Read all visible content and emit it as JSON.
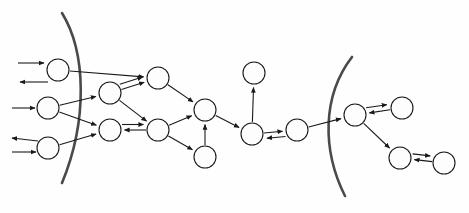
{
  "diagram": {
    "title": "",
    "type": "directed-graph-with-boundaries",
    "style": {
      "background": "#fefefe",
      "node_fill": "#fdfdfd",
      "node_stroke": "#1a1a1a",
      "node_stroke_width": 1.1,
      "edge_stroke": "#1a1a1a",
      "edge_stroke_width": 1.1,
      "boundary_stroke": "#4a4a4a",
      "boundary_stroke_width": 2.6,
      "arrowhead": "solid-triangle"
    },
    "node_radius": 11,
    "nodes": [
      {
        "id": "L1",
        "label": "",
        "cx": 58,
        "cy": 70,
        "r": 11,
        "group": "left-outer"
      },
      {
        "id": "L2",
        "label": "",
        "cx": 48,
        "cy": 108,
        "r": 11,
        "group": "left-outer"
      },
      {
        "id": "L3",
        "label": "",
        "cx": 48,
        "cy": 148,
        "r": 11,
        "group": "left-outer"
      },
      {
        "id": "M1",
        "label": "",
        "cx": 110,
        "cy": 93,
        "r": 11,
        "group": "left-inner"
      },
      {
        "id": "M2",
        "label": "",
        "cx": 110,
        "cy": 130,
        "r": 11,
        "group": "left-inner"
      },
      {
        "id": "M3",
        "label": "",
        "cx": 158,
        "cy": 78,
        "r": 11,
        "group": "middle"
      },
      {
        "id": "M4",
        "label": "",
        "cx": 158,
        "cy": 130,
        "r": 11,
        "group": "middle"
      },
      {
        "id": "M5",
        "label": "",
        "cx": 205,
        "cy": 110,
        "r": 11,
        "group": "middle"
      },
      {
        "id": "M6",
        "label": "",
        "cx": 205,
        "cy": 157,
        "r": 11,
        "group": "middle"
      },
      {
        "id": "C1",
        "label": "",
        "cx": 254,
        "cy": 73,
        "r": 11,
        "group": "center-top"
      },
      {
        "id": "C2",
        "label": "",
        "cx": 252,
        "cy": 134,
        "r": 11,
        "group": "center"
      },
      {
        "id": "C3",
        "label": "",
        "cx": 297,
        "cy": 130,
        "r": 11,
        "group": "center"
      },
      {
        "id": "R1",
        "label": "",
        "cx": 355,
        "cy": 115,
        "r": 11,
        "group": "right-inner"
      },
      {
        "id": "R2",
        "label": "",
        "cx": 402,
        "cy": 108,
        "r": 11,
        "group": "right-outer"
      },
      {
        "id": "R3",
        "label": "",
        "cx": 400,
        "cy": 158,
        "r": 11,
        "group": "right-inner"
      },
      {
        "id": "R4",
        "label": "",
        "cx": 444,
        "cy": 163,
        "r": 11,
        "group": "right-outer"
      }
    ],
    "boundaries": [
      {
        "id": "left-arc",
        "label": "left-boundary-arc",
        "d": "M 62 13 C 86 52, 88 120, 62 183"
      },
      {
        "id": "right-arc",
        "label": "right-boundary-arc",
        "d": "M 352 57 C 322 96, 322 150, 345 196"
      }
    ],
    "edges": [
      {
        "from": "external",
        "to": "L1",
        "note": "incoming from left edge"
      },
      {
        "from": "L1",
        "to": "external",
        "note": "outgoing to left edge"
      },
      {
        "from": "external",
        "to": "L2",
        "note": "incoming from left edge"
      },
      {
        "from": "L3",
        "to": "external",
        "note": "outgoing to left edge"
      },
      {
        "from": "external",
        "to": "L3",
        "note": "incoming from left edge"
      },
      {
        "from": "L1",
        "to": "M3"
      },
      {
        "from": "L2",
        "to": "M1"
      },
      {
        "from": "L2",
        "to": "M2"
      },
      {
        "from": "L3",
        "to": "M2"
      },
      {
        "from": "M1",
        "to": "M3"
      },
      {
        "from": "M1",
        "to": "M3",
        "note": "second parallel arrow"
      },
      {
        "from": "M1",
        "to": "M4"
      },
      {
        "from": "M4",
        "to": "M2",
        "note": "leftward arrow"
      },
      {
        "from": "M2",
        "to": "M4",
        "note": "rightward arrow"
      },
      {
        "from": "M3",
        "to": "M5"
      },
      {
        "from": "M4",
        "to": "M5"
      },
      {
        "from": "M4",
        "to": "M6"
      },
      {
        "from": "M6",
        "to": "M5"
      },
      {
        "from": "M5",
        "to": "C2"
      },
      {
        "from": "C2",
        "to": "C1",
        "note": "upward arrow"
      },
      {
        "from": "C2",
        "to": "C3",
        "note": "rightward arrow"
      },
      {
        "from": "C3",
        "to": "C2",
        "note": "leftward return arrow"
      },
      {
        "from": "C3",
        "to": "R1"
      },
      {
        "from": "R2",
        "to": "R1",
        "note": "leftward arrow"
      },
      {
        "from": "R1",
        "to": "R2",
        "note": "rightward arrow"
      },
      {
        "from": "R1",
        "to": "R3"
      },
      {
        "from": "R4",
        "to": "R3",
        "note": "leftward arrow"
      },
      {
        "from": "R3",
        "to": "R4",
        "note": "rightward arrow"
      }
    ],
    "external_stubs": [
      {
        "id": "stub-in-1",
        "label": "incoming-arrow-top",
        "x1": 18,
        "y1": 63,
        "x2": 44,
        "y2": 63,
        "arrow": "end"
      },
      {
        "id": "stub-out-1",
        "label": "outgoing-arrow-top",
        "x1": 48,
        "y1": 82,
        "x2": 20,
        "y2": 82,
        "arrow": "end"
      },
      {
        "id": "stub-in-2",
        "label": "incoming-arrow-middle",
        "x1": 12,
        "y1": 108,
        "x2": 35,
        "y2": 108,
        "arrow": "end"
      },
      {
        "id": "stub-out-2",
        "label": "outgoing-arrow-bottom",
        "x1": 38,
        "y1": 141,
        "x2": 12,
        "y2": 138,
        "arrow": "end"
      },
      {
        "id": "stub-in-3",
        "label": "incoming-arrow-bottom",
        "x1": 12,
        "y1": 152,
        "x2": 36,
        "y2": 152,
        "arrow": "end"
      }
    ]
  }
}
